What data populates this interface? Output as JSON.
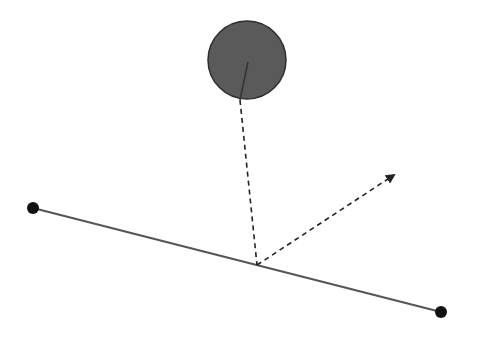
{
  "diagram": {
    "circle": {
      "cx": 247,
      "cy": 60,
      "r": 40,
      "fill": "#5a5a5a",
      "stroke": "#2e2e2e"
    },
    "radius_line": {
      "x1": 240,
      "y1": 100,
      "x2": 248,
      "y2": 62,
      "color": "#3a3a3a"
    },
    "segment": {
      "start": {
        "x": 33,
        "y": 208
      },
      "end": {
        "x": 441,
        "y": 312
      },
      "color": "#555555",
      "endpoint_color": "#111111",
      "endpoint_radius": 6
    },
    "projection": {
      "x1": 240,
      "y1": 100,
      "x2": 257,
      "y2": 265,
      "color": "#222222"
    },
    "direction_arrow": {
      "x1": 257,
      "y1": 265,
      "x2": 396,
      "y2": 174,
      "color": "#222222"
    }
  }
}
